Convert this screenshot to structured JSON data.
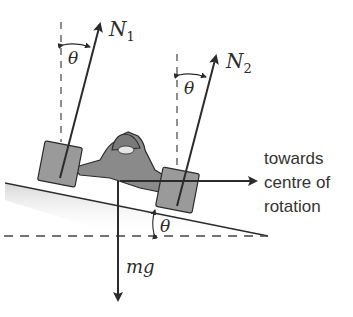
{
  "diagram": {
    "labels": {
      "n1": "N",
      "n1_sub": "1",
      "n2": "N",
      "n2_sub": "2",
      "theta_left": "θ",
      "theta_right": "θ",
      "theta_bank": "θ",
      "weight": "mg",
      "direction_line1": "towards",
      "direction_line2": "centre of",
      "direction_line3": "rotation"
    },
    "colors": {
      "line": "#2b2b2b",
      "car_body": "#8a8a8a",
      "wheel": "#9a9a9a",
      "slope_shade": "#e8e8e8",
      "dashed": "#444444"
    }
  }
}
